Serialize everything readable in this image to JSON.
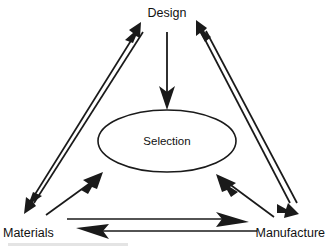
{
  "diagram": {
    "background_color": "#ffffff",
    "line_color": "#1a1a1a",
    "nodes": {
      "design": {
        "label": "Design",
        "x": 167,
        "y": 14
      },
      "materials": {
        "label": "Materials",
        "x": 34,
        "y": 233
      },
      "manufacture": {
        "label": "Manufacture",
        "x": 288,
        "y": 233
      },
      "selection": {
        "label": "Selection",
        "x": 167,
        "y": 142
      }
    },
    "center_shape": {
      "type": "ellipse",
      "label": "Selection",
      "cx": 167,
      "cy": 141,
      "rx": 69,
      "ry": 31
    },
    "edges": [
      {
        "name": "design-to-selection",
        "from": "Design",
        "to": "Selection",
        "direction": "one-way",
        "orientation": "vertical"
      },
      {
        "name": "design-materials-pair",
        "from": "Design",
        "to": "Materials",
        "direction": "two-way",
        "orientation": "left-diagonal"
      },
      {
        "name": "design-manufacture-pair",
        "from": "Design",
        "to": "Manufacture",
        "direction": "two-way",
        "orientation": "right-diagonal"
      },
      {
        "name": "materials-to-selection",
        "from": "Materials",
        "to": "Selection",
        "direction": "one-way",
        "orientation": "lower-left-diagonal"
      },
      {
        "name": "manufacture-to-selection",
        "from": "Manufacture",
        "to": "Selection",
        "direction": "one-way",
        "orientation": "lower-right-diagonal"
      },
      {
        "name": "materials-to-manufacture",
        "from": "Materials",
        "to": "Manufacture",
        "direction": "one-way",
        "orientation": "horizontal-upper"
      },
      {
        "name": "manufacture-to-materials",
        "from": "Manufacture",
        "to": "Materials",
        "direction": "one-way",
        "orientation": "horizontal-lower"
      }
    ]
  }
}
